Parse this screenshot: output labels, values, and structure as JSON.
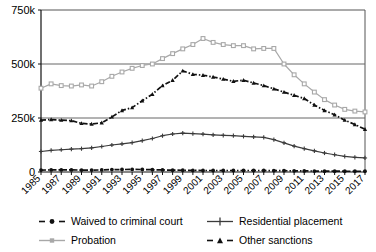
{
  "chart_data": {
    "type": "line",
    "title": "",
    "xlabel": "",
    "ylabel": "",
    "ylim": [
      0,
      750000
    ],
    "yticks": [
      0,
      250000,
      500000,
      750000
    ],
    "ytick_labels": [
      "0",
      "250k",
      "500k",
      "750k"
    ],
    "grid": true,
    "grid_axis": "y",
    "legend_position": "bottom",
    "x": [
      1985,
      1986,
      1987,
      1988,
      1989,
      1990,
      1991,
      1992,
      1993,
      1994,
      1995,
      1996,
      1997,
      1998,
      1999,
      2000,
      2001,
      2002,
      2003,
      2004,
      2005,
      2006,
      2007,
      2008,
      2009,
      2010,
      2011,
      2012,
      2013,
      2014,
      2015,
      2016,
      2017
    ],
    "xtick_labels": [
      "1985",
      "1987",
      "1989",
      "1991",
      "1993",
      "1995",
      "1997",
      "1999",
      "2001",
      "2003",
      "2005",
      "2007",
      "2009",
      "2011",
      "2013",
      "2015",
      "2017"
    ],
    "series": [
      {
        "name": "Waived to criminal court",
        "color": "#111111",
        "marker": "circle",
        "dash": "dashdot",
        "values": [
          9000,
          9500,
          9500,
          9500,
          9000,
          9000,
          9500,
          11000,
          11500,
          12000,
          11500,
          10500,
          9500,
          8500,
          8000,
          7500,
          7000,
          7000,
          7000,
          7000,
          7000,
          7000,
          7000,
          6500,
          6000,
          5500,
          5000,
          4500,
          4000,
          4000,
          3500,
          3500,
          3500
        ]
      },
      {
        "name": "Residential placement",
        "color": "#3b3b3b",
        "marker": "plus",
        "dash": "solid",
        "values": [
          95000,
          100000,
          103000,
          106000,
          108000,
          112000,
          118000,
          125000,
          130000,
          136000,
          145000,
          155000,
          168000,
          176000,
          180000,
          178000,
          175000,
          172000,
          170000,
          168000,
          165000,
          163000,
          160000,
          150000,
          135000,
          120000,
          108000,
          98000,
          88000,
          80000,
          72000,
          68000,
          65000
        ]
      },
      {
        "name": "Probation",
        "color": "#a8a8a8",
        "marker": "square",
        "dash": "solid",
        "values": [
          388000,
          408000,
          400000,
          398000,
          403000,
          398000,
          418000,
          443000,
          463000,
          480000,
          493000,
          500000,
          525000,
          548000,
          570000,
          590000,
          618000,
          600000,
          590000,
          585000,
          585000,
          570000,
          572000,
          572000,
          500000,
          450000,
          408000,
          370000,
          335000,
          310000,
          290000,
          282000,
          278000
        ]
      },
      {
        "name": "Other sanctions",
        "color": "#111111",
        "marker": "triangle",
        "dash": "dashdot",
        "values": [
          240000,
          243000,
          240000,
          238000,
          225000,
          222000,
          228000,
          255000,
          285000,
          298000,
          330000,
          360000,
          400000,
          425000,
          468000,
          452000,
          448000,
          440000,
          430000,
          420000,
          425000,
          412000,
          400000,
          385000,
          370000,
          355000,
          340000,
          310000,
          285000,
          265000,
          240000,
          220000,
          198000
        ]
      }
    ]
  },
  "legend": {
    "items": [
      {
        "label": "Waived to criminal court"
      },
      {
        "label": "Residential placement"
      },
      {
        "label": "Probation"
      },
      {
        "label": "Other sanctions"
      }
    ]
  }
}
